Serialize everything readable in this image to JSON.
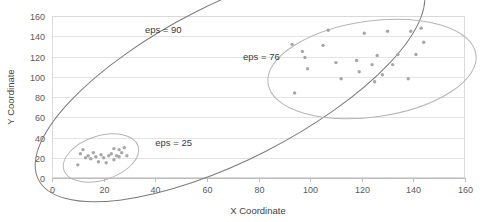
{
  "chart_data": {
    "type": "scatter",
    "title": "",
    "xlabel": "X Coordinate",
    "ylabel": "Y Coordinate",
    "xlim": [
      0,
      160
    ],
    "ylim": [
      0,
      160
    ],
    "xticks": [
      0,
      20,
      40,
      60,
      80,
      100,
      120,
      140,
      160
    ],
    "yticks": [
      0,
      20,
      40,
      60,
      80,
      100,
      120,
      140,
      160
    ],
    "grid": "horizontal",
    "legend": "none",
    "point_color": "#a6a6a6",
    "series": [
      {
        "name": "cluster-small",
        "points": [
          [
            10,
            13
          ],
          [
            11,
            24
          ],
          [
            12,
            28
          ],
          [
            13,
            20
          ],
          [
            14,
            22
          ],
          [
            15,
            19
          ],
          [
            16,
            25
          ],
          [
            17,
            21
          ],
          [
            18,
            16
          ],
          [
            19,
            23
          ],
          [
            20,
            20
          ],
          [
            21,
            15
          ],
          [
            22,
            22
          ],
          [
            23,
            24
          ],
          [
            24,
            18
          ],
          [
            24,
            29
          ],
          [
            25,
            22
          ],
          [
            26,
            28
          ],
          [
            26,
            21
          ],
          [
            27,
            25
          ],
          [
            28,
            30
          ],
          [
            29,
            22
          ]
        ]
      },
      {
        "name": "cluster-large",
        "points": [
          [
            93,
            132
          ],
          [
            94,
            84
          ],
          [
            97,
            125
          ],
          [
            98,
            119
          ],
          [
            99,
            108
          ],
          [
            105,
            131
          ],
          [
            107,
            146
          ],
          [
            110,
            114
          ],
          [
            112,
            98
          ],
          [
            118,
            116
          ],
          [
            119,
            105
          ],
          [
            121,
            143
          ],
          [
            124,
            112
          ],
          [
            125,
            95
          ],
          [
            126,
            121
          ],
          [
            128,
            102
          ],
          [
            130,
            145
          ],
          [
            132,
            112
          ],
          [
            134,
            122
          ],
          [
            138,
            98
          ],
          [
            139,
            145
          ],
          [
            141,
            122
          ],
          [
            143,
            148
          ],
          [
            144,
            134
          ]
        ]
      }
    ],
    "annotations": [
      {
        "name": "eps-90",
        "label": "eps = 90",
        "x": 36,
        "y": 143,
        "shape": "ellipse",
        "ellipse": {
          "cx": 230,
          "cy": 82,
          "rx": 215,
          "ry": 78,
          "rotation": -27,
          "stroke": "#7b7b7b",
          "stroke_width": 1.0
        }
      },
      {
        "name": "eps-76",
        "label": "eps = 76",
        "x": 74,
        "y": 117,
        "shape": "ellipse",
        "ellipse": {
          "cx": 372,
          "cy": 69,
          "rx": 105,
          "ry": 48,
          "rotation": -8,
          "stroke": "#b5b5b5",
          "stroke_width": 1.0
        }
      },
      {
        "name": "eps-25",
        "label": "eps = 25",
        "x": 40,
        "y": 32,
        "shape": "ellipse",
        "ellipse": {
          "cx": 101,
          "cy": 158,
          "rx": 39,
          "ry": 22,
          "rotation": -18,
          "stroke": "#b5b5b5",
          "stroke_width": 1.0
        }
      }
    ]
  },
  "axes": {
    "x_title": "X Coordinate",
    "y_title": "Y Coordinate",
    "x_tick_labels": [
      "0",
      "20",
      "40",
      "60",
      "80",
      "100",
      "120",
      "140",
      "160"
    ],
    "y_tick_labels": [
      "0",
      "20",
      "40",
      "60",
      "80",
      "100",
      "120",
      "140",
      "160"
    ]
  },
  "annotation_labels": {
    "eps_90": "eps = 90",
    "eps_76": "eps = 76",
    "eps_25": "eps = 25"
  }
}
